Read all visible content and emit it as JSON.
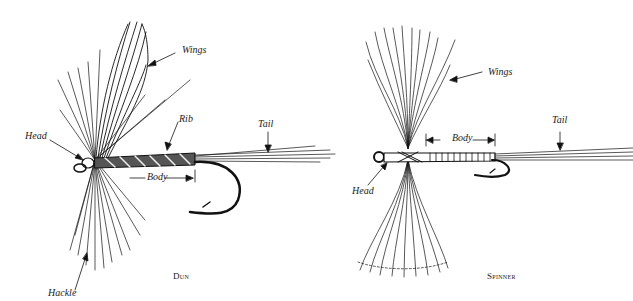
{
  "figures": [
    {
      "caption": "Dun",
      "labels": {
        "wings": "Wings",
        "head": "Head",
        "rib": "Rib",
        "tail": "Tail",
        "body": "Body",
        "hackle": "Hackle"
      }
    },
    {
      "caption": "Spinner",
      "labels": {
        "wings": "Wings",
        "head": "Head",
        "body": "Body",
        "tail": "Tail"
      }
    }
  ],
  "colors": {
    "ink": "#111111",
    "background": "#ffffff"
  }
}
